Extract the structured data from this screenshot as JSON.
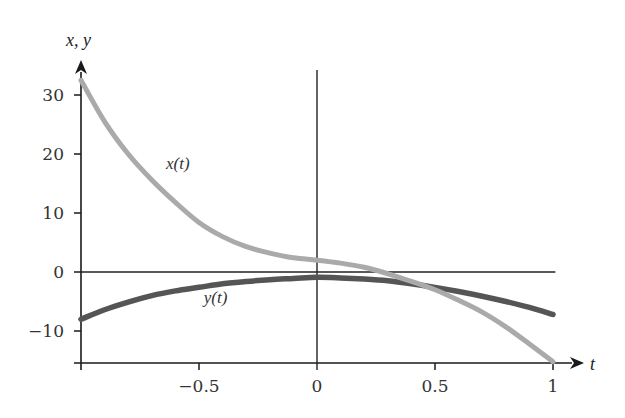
{
  "chart_data": {
    "type": "line",
    "title": "",
    "xlabel": "t",
    "ylabel": "x, y",
    "xlim": [
      -1,
      1
    ],
    "ylim": [
      -15,
      33
    ],
    "grid": false,
    "legend": "inline labels",
    "x_ticks": [
      -1,
      -0.5,
      0,
      0.5,
      1
    ],
    "x_tick_labels": [
      "",
      "-0.5",
      "0",
      "0.5",
      "1"
    ],
    "y_ticks": [
      -10,
      0,
      10,
      20,
      30
    ],
    "y_tick_labels": [
      "-10",
      "0",
      "10",
      "20",
      "30"
    ],
    "x": [
      -1,
      -0.9,
      -0.8,
      -0.7,
      -0.6,
      -0.5,
      -0.4,
      -0.3,
      -0.2,
      -0.1,
      0,
      0.1,
      0.2,
      0.3,
      0.4,
      0.5,
      0.6,
      0.7,
      0.8,
      0.9,
      1
    ],
    "series": [
      {
        "name": "x(t)",
        "label": "x(t)",
        "color": "#aaaaaa",
        "values": [
          32.5,
          25.5,
          20.0,
          15.6,
          11.8,
          8.4,
          6.0,
          4.3,
          3.2,
          2.4,
          2.0,
          1.5,
          0.8,
          -0.3,
          -1.6,
          -3.0,
          -4.8,
          -6.8,
          -9.3,
          -12.2,
          -15.2
        ]
      },
      {
        "name": "y(t)",
        "label": "y(t)",
        "color": "#555555",
        "values": [
          -8.0,
          -6.4,
          -5.1,
          -4.0,
          -3.2,
          -2.6,
          -2.0,
          -1.6,
          -1.3,
          -1.1,
          -0.9,
          -1.0,
          -1.2,
          -1.5,
          -2.0,
          -2.6,
          -3.3,
          -4.1,
          -5.0,
          -6.0,
          -7.2
        ]
      }
    ],
    "annotations": [
      {
        "text": "x(t)",
        "x": -0.64,
        "y": 17.5
      },
      {
        "text": "y(t)",
        "x": -0.48,
        "y": -5.3
      }
    ],
    "horizontal_reference_line": {
      "y": 0,
      "x_range": [
        -1,
        1.01
      ]
    },
    "vertical_reference_line": {
      "x": 0,
      "y_range": [
        -15,
        34.5
      ]
    }
  },
  "labels": {
    "y_axis_title": "x, y",
    "x_axis_title": "t",
    "x_curve_label": "x(t)",
    "y_curve_label": "y(t)"
  }
}
